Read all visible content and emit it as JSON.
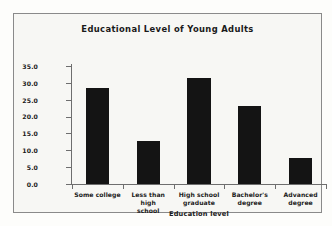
{
  "chart_data": {
    "type": "bar",
    "title": "Educational Level of Young Adults",
    "xlabel": "Education level",
    "ylabel": "Percent of people aged 25 to 34",
    "categories": [
      "Some college",
      "Less than high school",
      "High school graduate",
      "Bachelor's degree",
      "Advanced degree"
    ],
    "values": [
      28.5,
      12.8,
      31.5,
      23.0,
      7.8
    ],
    "ylim": [
      0.0,
      35.0
    ],
    "ytick_labels": [
      "35.0",
      "30.0",
      "25.0",
      "20.0",
      "15.0",
      "10.0",
      "5.0",
      "0.0"
    ],
    "ytick_values": [
      35.0,
      30.0,
      25.0,
      20.0,
      15.0,
      10.0,
      5.0,
      0.0
    ],
    "grid": false,
    "legend": false,
    "bar_color": "#141414",
    "axis_color": "#6e6e6e",
    "frame_color": "#8a8a8a",
    "background_color": "#f7f7f4"
  },
  "category_lines": [
    [
      "Some college"
    ],
    [
      "Less than high",
      "school"
    ],
    [
      "High school",
      "graduate"
    ],
    [
      "Bachelor's",
      "degree"
    ],
    [
      "Advanced",
      "degree"
    ]
  ]
}
